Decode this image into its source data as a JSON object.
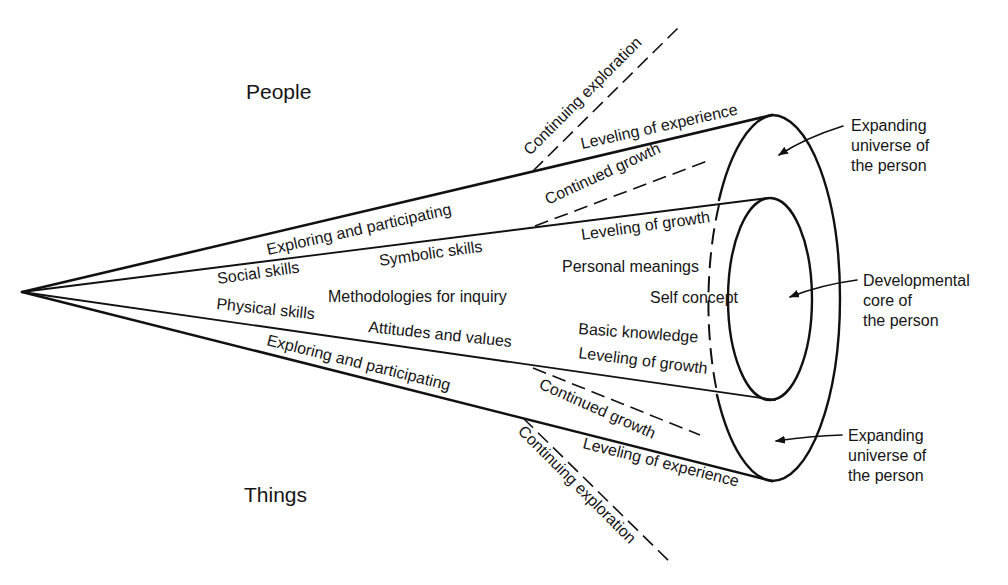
{
  "diagram": {
    "poles": {
      "top": "People",
      "bottom": "Things"
    },
    "upper_band": {
      "outer_line_label": "Exploring and participating",
      "outer_edge_label": "Leveling of experience",
      "inner_edge_label": "Leveling of growth",
      "divergent_dashed_outer": "Continuing exploration",
      "divergent_dashed_inner": "Continued growth"
    },
    "lower_band": {
      "outer_line_label": "Exploring and participating",
      "outer_edge_label": "Leveling of experience",
      "inner_edge_label": "Leveling of growth",
      "divergent_dashed_outer": "Continuing exploration",
      "divergent_dashed_inner": "Continued growth"
    },
    "inner_cone_labels": {
      "social": "Social skills",
      "symbolic": "Symbolic skills",
      "methodologies": "Methodologies for inquiry",
      "physical": "Physical skills",
      "attitudes": "Attitudes and values",
      "personal": "Personal meanings",
      "self": "Self concept",
      "basic": "Basic knowledge"
    },
    "callouts": {
      "upper_universe": [
        "Expanding",
        "universe of",
        "the person"
      ],
      "core": [
        "Developmental",
        "core of",
        "the person"
      ],
      "lower_universe": [
        "Expanding",
        "universe of",
        "the person"
      ]
    },
    "colors": {
      "ink": "#111111",
      "background": "#ffffff"
    }
  }
}
